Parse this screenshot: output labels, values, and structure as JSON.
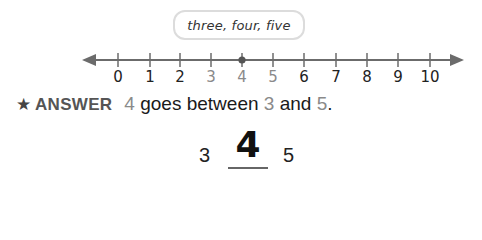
{
  "callout": {
    "text": "three, four, five"
  },
  "number_line": {
    "min": 0,
    "max": 10,
    "ticks": [
      {
        "label": "0",
        "x": 118,
        "highlight": false
      },
      {
        "label": "1",
        "x": 150,
        "highlight": false
      },
      {
        "label": "2",
        "x": 180,
        "highlight": false
      },
      {
        "label": "3",
        "x": 211,
        "highlight": true
      },
      {
        "label": "4",
        "x": 242,
        "highlight": true
      },
      {
        "label": "5",
        "x": 273,
        "highlight": true
      },
      {
        "label": "6",
        "x": 304,
        "highlight": false
      },
      {
        "label": "7",
        "x": 336,
        "highlight": false
      },
      {
        "label": "8",
        "x": 367,
        "highlight": false
      },
      {
        "label": "9",
        "x": 398,
        "highlight": false
      },
      {
        "label": "10",
        "x": 430,
        "highlight": false
      }
    ],
    "marked_point": 4,
    "line_color": "#6b6b6b",
    "highlight_color": "#8a8a8a"
  },
  "answer": {
    "label": "ANSWER",
    "number": "4",
    "text_1": " goes between ",
    "low": "3",
    "text_2": " and ",
    "high": "5",
    "end": "."
  },
  "work": {
    "left": "3",
    "middle": "4",
    "right": "5"
  }
}
